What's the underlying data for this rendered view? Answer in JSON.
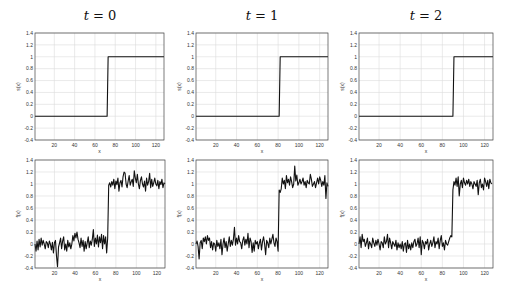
{
  "figure": {
    "columns": [
      {
        "title_var": "t",
        "title_eq": "=",
        "title_val": "0",
        "step_x": 72
      },
      {
        "title_var": "t",
        "title_eq": "=",
        "title_val": "1",
        "step_x": 82
      },
      {
        "title_var": "t",
        "title_eq": "=",
        "title_val": "2",
        "step_x": 90
      }
    ]
  },
  "chart_data": [
    {
      "type": "line",
      "title": "t = 0",
      "row": "top",
      "xlabel": "x",
      "ylabel": "s(x)",
      "xlim": [
        1,
        128
      ],
      "ylim": [
        -0.4,
        1.4
      ],
      "xticks": [
        20,
        40,
        60,
        80,
        100,
        120
      ],
      "yticks": [
        -0.4,
        -0.2,
        0,
        0.2,
        0.4,
        0.6,
        0.8,
        1,
        1.2,
        1.4
      ],
      "grid": true,
      "series": [
        {
          "name": "s(x)",
          "x": [
            1,
            72,
            73,
            128
          ],
          "y": [
            0,
            0,
            1,
            1
          ]
        }
      ]
    },
    {
      "type": "line",
      "title": "t = 1",
      "row": "top",
      "xlabel": "x",
      "ylabel": "s(x)",
      "xlim": [
        1,
        128
      ],
      "ylim": [
        -0.4,
        1.4
      ],
      "xticks": [
        20,
        40,
        60,
        80,
        100,
        120
      ],
      "yticks": [
        -0.4,
        -0.2,
        0,
        0.2,
        0.4,
        0.6,
        0.8,
        1,
        1.2,
        1.4
      ],
      "grid": true,
      "series": [
        {
          "name": "s(x)",
          "x": [
            1,
            81,
            82,
            128
          ],
          "y": [
            0,
            0,
            1,
            1
          ]
        }
      ]
    },
    {
      "type": "line",
      "title": "t = 2",
      "row": "top",
      "xlabel": "x",
      "ylabel": "s(x)",
      "xlim": [
        1,
        128
      ],
      "ylim": [
        -0.4,
        1.4
      ],
      "xticks": [
        20,
        40,
        60,
        80,
        100,
        120
      ],
      "yticks": [
        -0.4,
        -0.2,
        0,
        0.2,
        0.4,
        0.6,
        0.8,
        1,
        1.2,
        1.4
      ],
      "grid": true,
      "series": [
        {
          "name": "s(x)",
          "x": [
            1,
            90,
            91,
            128
          ],
          "y": [
            0,
            0,
            1,
            1
          ]
        }
      ]
    },
    {
      "type": "line",
      "title": "",
      "row": "bottom",
      "xlabel": "x",
      "ylabel": "f(x)",
      "xlim": [
        1,
        128
      ],
      "ylim": [
        -0.4,
        1.4
      ],
      "xticks": [
        20,
        40,
        60,
        80,
        100,
        120
      ],
      "yticks": [
        -0.4,
        -0.2,
        0,
        0.2,
        0.4,
        0.6,
        0.8,
        1,
        1.2,
        1.4
      ],
      "grid": true,
      "series": [
        {
          "name": "f(x)",
          "x_start": 1,
          "x_step": 1,
          "y": [
            0.0,
            -0.12,
            0.05,
            -0.1,
            0.08,
            -0.05,
            0.1,
            -0.02,
            0.06,
            0.0,
            -0.08,
            0.04,
            0.02,
            -0.06,
            0.05,
            0.0,
            -0.1,
            0.03,
            -0.15,
            0.02,
            0.06,
            -0.2,
            -0.38,
            -0.05,
            0.02,
            0.1,
            -0.08,
            0.05,
            0.12,
            -0.1,
            0.0,
            -0.12,
            0.06,
            -0.05,
            0.02,
            -0.08,
            0.0,
            0.14,
            0.05,
            0.18,
            0.1,
            0.2,
            0.08,
            0.02,
            -0.06,
            0.1,
            -0.04,
            0.06,
            -0.12,
            0.04,
            -0.08,
            0.02,
            0.12,
            -0.06,
            0.05,
            -0.02,
            0.08,
            0.24,
            -0.04,
            0.1,
            0.0,
            0.15,
            -0.05,
            0.12,
            0.02,
            0.16,
            -0.08,
            0.14,
            0.0,
            0.12,
            -0.15,
            0.1,
            0.98,
            1.02,
            0.95,
            1.04,
            0.98,
            1.08,
            0.92,
            1.05,
            0.99,
            1.1,
            0.88,
            1.02,
            1.06,
            0.95,
            1.12,
            1.2,
            1.18,
            1.0,
            0.94,
            1.05,
            1.14,
            0.98,
            1.04,
            1.08,
            0.96,
            1.22,
            1.1,
            1.02,
            1.16,
            1.0,
            0.92,
            1.06,
            1.12,
            1.0,
            0.95,
            1.05,
            0.88,
            1.1,
            0.98,
            1.04,
            1.18,
            0.94,
            1.08,
            0.96,
            1.02,
            1.1,
            1.0,
            0.97,
            1.06,
            0.92,
            1.04,
            0.99,
            1.08,
            0.94,
            1.02,
            1.0
          ]
        }
      ]
    },
    {
      "type": "line",
      "title": "",
      "row": "bottom",
      "xlabel": "x",
      "ylabel": "f(x)",
      "xlim": [
        1,
        128
      ],
      "ylim": [
        -0.4,
        1.4
      ],
      "xticks": [
        20,
        40,
        60,
        80,
        100,
        120
      ],
      "yticks": [
        -0.4,
        -0.2,
        0,
        0.2,
        0.4,
        0.6,
        0.8,
        1,
        1.2,
        1.4
      ],
      "grid": true,
      "series": [
        {
          "name": "f(x)",
          "x_start": 1,
          "x_step": 1,
          "y": [
            0.0,
            0.05,
            -0.04,
            -0.25,
            0.02,
            0.06,
            -0.08,
            0.1,
            0.04,
            0.12,
            0.0,
            0.14,
            0.06,
            0.1,
            -0.06,
            0.04,
            -0.1,
            0.02,
            0.0,
            -0.12,
            0.06,
            -0.04,
            0.02,
            -0.08,
            0.08,
            -0.18,
            0.0,
            0.1,
            -0.06,
            0.04,
            -0.12,
            0.0,
            0.12,
            -0.04,
            0.06,
            -0.02,
            0.08,
            0.28,
            -0.02,
            0.1,
            0.0,
            0.14,
            0.04,
            0.02,
            -0.08,
            0.06,
            0.12,
            -0.02,
            0.08,
            0.0,
            0.18,
            -0.06,
            0.1,
            0.04,
            -0.14,
            0.02,
            -0.12,
            0.06,
            0.0,
            0.04,
            -0.08,
            0.02,
            0.08,
            -0.1,
            0.04,
            0.12,
            0.0,
            -0.18,
            0.06,
            0.02,
            -0.06,
            0.1,
            0.0,
            0.08,
            0.16,
            0.02,
            -0.04,
            0.1,
            0.04,
            -0.12,
            0.9,
            0.86,
            0.92,
            1.1,
            1.0,
            1.06,
            0.92,
            1.14,
            1.02,
            1.08,
            0.98,
            1.12,
            1.04,
            0.94,
            1.0,
            1.3,
            1.05,
            1.15,
            0.98,
            1.02,
            1.08,
            1.0,
            1.04,
            1.1,
            0.98,
            1.04,
            0.94,
            1.06,
            1.02,
            1.0,
            1.16,
            1.08,
            0.96,
            1.0,
            1.04,
            0.94,
            1.02,
            1.1,
            1.0,
            1.12,
            1.06,
            0.96,
            1.04,
            0.98,
            1.14,
            0.76,
            1.02,
            0.96
          ]
        }
      ]
    },
    {
      "type": "line",
      "title": "",
      "row": "bottom",
      "xlabel": "x",
      "ylabel": "f(x)",
      "xlim": [
        1,
        128
      ],
      "ylim": [
        -0.4,
        1.4
      ],
      "xticks": [
        20,
        40,
        60,
        80,
        100,
        120
      ],
      "yticks": [
        -0.4,
        -0.2,
        0,
        0.2,
        0.4,
        0.6,
        0.8,
        1,
        1.2,
        1.4
      ],
      "grid": true,
      "series": [
        {
          "name": "f(x)",
          "x_start": 1,
          "x_step": 1,
          "y": [
            0.0,
            0.12,
            -0.06,
            0.16,
            0.04,
            0.08,
            -0.04,
            0.02,
            0.1,
            -0.08,
            0.04,
            0.0,
            -0.06,
            0.1,
            0.02,
            -0.04,
            0.06,
            -0.02,
            0.08,
            0.0,
            -0.1,
            0.04,
            0.02,
            -0.06,
            0.12,
            0.0,
            0.04,
            0.16,
            -0.06,
            0.1,
            0.02,
            -0.08,
            0.04,
            0.0,
            -0.04,
            0.06,
            -0.1,
            0.02,
            -0.06,
            0.0,
            -0.08,
            0.04,
            -0.12,
            0.0,
            0.02,
            -0.14,
            0.06,
            -0.08,
            0.0,
            -0.1,
            0.02,
            -0.06,
            0.04,
            0.08,
            -0.04,
            0.0,
            0.1,
            -0.06,
            0.12,
            -0.18,
            0.06,
            0.02,
            -0.08,
            0.04,
            0.0,
            0.08,
            -0.1,
            0.0,
            0.06,
            -0.04,
            0.02,
            0.12,
            -0.06,
            0.04,
            0.0,
            0.1,
            -0.08,
            0.06,
            0.14,
            -0.04,
            0.02,
            -0.1,
            0.06,
            0.0,
            -0.02,
            0.04,
            0.1,
            0.14,
            0.12,
            0.9,
            1.04,
            0.98,
            1.1,
            0.96,
            1.12,
            0.8,
            1.0,
            1.06,
            0.94,
            1.1,
            1.02,
            0.98,
            1.06,
            1.0,
            1.08,
            0.96,
            1.04,
            1.0,
            0.92,
            1.04,
            1.0,
            0.96,
            1.06,
            0.82,
            1.02,
            1.08,
            0.94,
            1.0,
            0.9,
            1.1,
            1.04,
            0.96,
            1.06,
            0.92,
            1.08,
            1.02,
            1.0
          ]
        }
      ]
    }
  ]
}
